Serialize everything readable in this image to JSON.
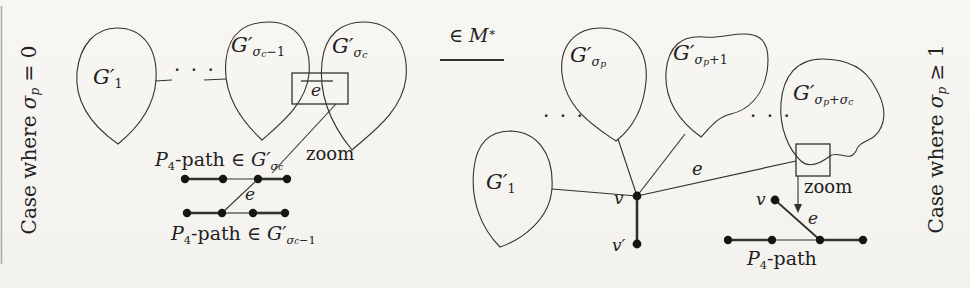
{
  "colors": {
    "background": "#f6f5f2",
    "ink": "#33312d",
    "vertex": "#161513",
    "text": "#23211e"
  },
  "left_case": {
    "side_label": [
      {
        "t": "Case where ",
        "r": 1
      },
      {
        "t": "σ"
      },
      {
        "t": "p",
        "l": 1
      },
      {
        "t": " = 0",
        "r": 1
      }
    ],
    "blob_g1_label": [
      {
        "t": "G′"
      },
      {
        "t": "1",
        "l": 1,
        "r": 1
      }
    ],
    "blob_gsc_minus1_label": [
      {
        "t": "G′"
      },
      {
        "t": "σ",
        "l": 1
      },
      {
        "t": "c",
        "l": 2
      },
      {
        "t": "−1",
        "l": 1,
        "r": 1
      }
    ],
    "blob_gsc_label": [
      {
        "t": "G′"
      },
      {
        "t": "σ",
        "l": 1
      },
      {
        "t": "c",
        "l": 2
      }
    ],
    "ellipsis": "· · ·",
    "box_edge_label": [
      {
        "t": "e"
      }
    ],
    "zoom_label": [
      {
        "t": "zoom",
        "r": 1
      }
    ],
    "p4_top_label": [
      {
        "t": "P"
      },
      {
        "t": "4",
        "l": 1,
        "r": 1
      },
      {
        "t": "-path ",
        "r": 1
      },
      {
        "t": "∈ ",
        "r": 1
      },
      {
        "t": "G′"
      },
      {
        "t": "σ",
        "l": 1
      },
      {
        "t": "c",
        "l": 2
      }
    ],
    "edge_e_label": [
      {
        "t": "e"
      }
    ],
    "p4_bottom_label": [
      {
        "t": "P"
      },
      {
        "t": "4",
        "l": 1,
        "r": 1
      },
      {
        "t": "-path ",
        "r": 1
      },
      {
        "t": "∈ ",
        "r": 1
      },
      {
        "t": "G′"
      },
      {
        "t": "σ",
        "l": 1
      },
      {
        "t": "c",
        "l": 2
      },
      {
        "t": "−1",
        "l": 1,
        "r": 1
      }
    ]
  },
  "legend": {
    "label": [
      {
        "t": "∈ ",
        "r": 1
      },
      {
        "t": "M"
      },
      {
        "t": "∗",
        "p": 1
      }
    ]
  },
  "right_case": {
    "side_label": [
      {
        "t": "Case where ",
        "r": 1
      },
      {
        "t": "σ"
      },
      {
        "t": "p",
        "l": 1
      },
      {
        "t": " ≥ 1",
        "r": 1
      }
    ],
    "blob_g1_label": [
      {
        "t": "G′"
      },
      {
        "t": "1",
        "l": 1,
        "r": 1
      }
    ],
    "blob_gsp_label": [
      {
        "t": "G′"
      },
      {
        "t": "σ",
        "l": 1
      },
      {
        "t": "p",
        "l": 2
      }
    ],
    "blob_gsp_plus1_label": [
      {
        "t": "G′"
      },
      {
        "t": "σ",
        "l": 1
      },
      {
        "t": "p",
        "l": 2
      },
      {
        "t": "+1",
        "l": 1,
        "r": 1
      }
    ],
    "blob_gsp_plus_sc_label": [
      {
        "t": "G′"
      },
      {
        "t": "σ",
        "l": 1
      },
      {
        "t": "p",
        "l": 2
      },
      {
        "t": "+",
        "l": 1,
        "r": 1
      },
      {
        "t": "σ",
        "l": 1
      },
      {
        "t": "c",
        "l": 2
      }
    ],
    "ellipsis_left": "· · ·",
    "ellipsis_right": "· · ·",
    "edge_e_label": [
      {
        "t": "e"
      }
    ],
    "v_label": [
      {
        "t": "v"
      }
    ],
    "vprime_label": [
      {
        "t": "v′"
      }
    ],
    "zoom_label": [
      {
        "t": "zoom",
        "r": 1
      }
    ],
    "inset_v_label": [
      {
        "t": "v"
      }
    ],
    "inset_e_label": [
      {
        "t": "e"
      }
    ],
    "p4_label": [
      {
        "t": "P"
      },
      {
        "t": "4",
        "l": 1,
        "r": 1
      },
      {
        "t": "-path",
        "r": 1
      }
    ]
  }
}
